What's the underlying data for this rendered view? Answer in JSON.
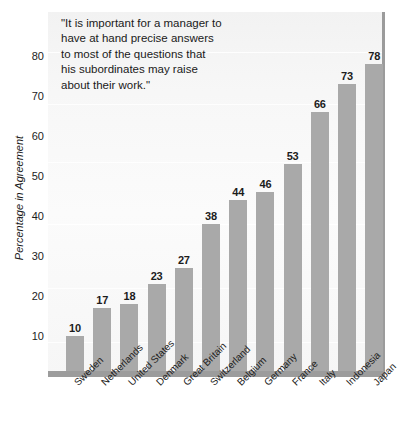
{
  "chart_data": {
    "type": "bar",
    "title": "",
    "subtitle": "",
    "xlabel": "",
    "ylabel": "Percentage in Agreement",
    "categories": [
      "Sweden",
      "Netherlands",
      "United States",
      "Denmark",
      "Great Britain",
      "Switzerland",
      "Belgium",
      "Germany",
      "France",
      "Italy",
      "Indonesia",
      "Japan"
    ],
    "values": [
      10,
      17,
      18,
      23,
      27,
      38,
      44,
      46,
      53,
      66,
      73,
      78
    ],
    "value_labels": [
      "10",
      "17",
      "18",
      "23",
      "27",
      "38",
      "44",
      "46",
      "53",
      "66",
      "73",
      "78"
    ],
    "ylim": [
      0,
      88
    ],
    "y_ticks": [
      10,
      20,
      30,
      40,
      50,
      60,
      70,
      80
    ],
    "y_tick_labels": [
      "10",
      "20",
      "30",
      "40",
      "50",
      "60",
      "70",
      "80"
    ],
    "grid": false,
    "legend": "none",
    "bar_color": "#a9a9a9",
    "baseline_color": "#9c9c9c",
    "plot_background": "#f7f7f7",
    "text_color": "#1c1c1c"
  },
  "annotation": {
    "name": "quote",
    "lines": [
      "\"It is important for a manager to",
      "have at hand precise answers",
      "to most of the questions that",
      "his subordinates may raise",
      "about their work.\""
    ]
  }
}
